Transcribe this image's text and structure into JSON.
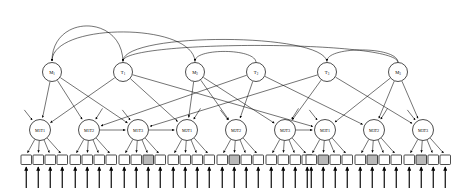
{
  "diagram": {
    "type": "directed-acyclic-graph",
    "canvas": {
      "width": 453,
      "height": 190
    },
    "levels": [
      {
        "name": "top-level",
        "y": 72,
        "nodes": [
          {
            "id": "M1",
            "label": "M",
            "sub": "1",
            "x": 52,
            "r": 9.5
          },
          {
            "id": "T1",
            "label": "T",
            "sub": "1",
            "x": 123,
            "r": 9.5
          },
          {
            "id": "M2",
            "label": "M",
            "sub": "2",
            "x": 195,
            "r": 9.5
          },
          {
            "id": "T2",
            "label": "T",
            "sub": "2",
            "x": 256,
            "r": 9.5
          },
          {
            "id": "T3",
            "label": "T",
            "sub": "3",
            "x": 327,
            "r": 9.5
          },
          {
            "id": "M3",
            "label": "M",
            "sub": "3",
            "x": 398,
            "r": 9.5
          }
        ]
      },
      {
        "name": "mid-level",
        "y": 130,
        "nodes": [
          {
            "id": "M1T1",
            "label": "M1T1",
            "x": 40,
            "r": 10.5
          },
          {
            "id": "M1T2",
            "label": "M1T2",
            "x": 89,
            "r": 10.5
          },
          {
            "id": "M1T3",
            "label": "M1T3",
            "x": 138,
            "r": 10.5
          },
          {
            "id": "M2T1",
            "label": "M2T1",
            "x": 187,
            "r": 10.5
          },
          {
            "id": "M2T2",
            "label": "M2T2",
            "x": 236,
            "r": 10.5
          },
          {
            "id": "M2T3",
            "label": "M2T3",
            "x": 285,
            "r": 10.5
          },
          {
            "id": "M3T1",
            "label": "M3T1",
            "x": 325,
            "r": 10.5
          },
          {
            "id": "M3T2",
            "label": "M3T2",
            "x": 374,
            "r": 10.5
          },
          {
            "id": "M3T3",
            "label": "M3T3",
            "x": 423,
            "r": 10.5
          }
        ]
      },
      {
        "name": "observation-level",
        "y": 155,
        "square": {
          "w": 10.5,
          "h": 9.5
        },
        "groups": [
          {
            "parent": "M1T1",
            "squares": [
              {
                "x": 21,
                "shaded": false
              },
              {
                "x": 33,
                "shaded": false
              },
              {
                "x": 45,
                "shaded": false
              },
              {
                "x": 57,
                "shaded": false
              }
            ]
          },
          {
            "parent": "M1T2",
            "squares": [
              {
                "x": 70,
                "shaded": false
              },
              {
                "x": 82,
                "shaded": false
              },
              {
                "x": 94,
                "shaded": false
              },
              {
                "x": 106,
                "shaded": false
              }
            ]
          },
          {
            "parent": "M1T3",
            "squares": [
              {
                "x": 119,
                "shaded": false
              },
              {
                "x": 131,
                "shaded": false
              },
              {
                "x": 143,
                "shaded": true
              },
              {
                "x": 155,
                "shaded": false
              }
            ]
          },
          {
            "parent": "M2T1",
            "squares": [
              {
                "x": 168,
                "shaded": false
              },
              {
                "x": 180,
                "shaded": false
              },
              {
                "x": 192,
                "shaded": false
              },
              {
                "x": 204,
                "shaded": false
              }
            ]
          },
          {
            "parent": "M2T2",
            "squares": [
              {
                "x": 217,
                "shaded": false
              },
              {
                "x": 229,
                "shaded": true
              },
              {
                "x": 241,
                "shaded": false
              },
              {
                "x": 253,
                "shaded": false
              }
            ]
          },
          {
            "parent": "M2T3",
            "squares": [
              {
                "x": 266,
                "shaded": false
              },
              {
                "x": 278,
                "shaded": false
              },
              {
                "x": 290,
                "shaded": false
              },
              {
                "x": 302,
                "shaded": false
              }
            ]
          },
          {
            "parent": "M3T1",
            "squares": [
              {
                "x": 306,
                "shaded": false
              },
              {
                "x": 318,
                "shaded": true
              },
              {
                "x": 330,
                "shaded": false
              },
              {
                "x": 342,
                "shaded": false
              }
            ]
          },
          {
            "parent": "M3T2",
            "squares": [
              {
                "x": 355,
                "shaded": false
              },
              {
                "x": 367,
                "shaded": true
              },
              {
                "x": 379,
                "shaded": false
              },
              {
                "x": 391,
                "shaded": false
              }
            ]
          },
          {
            "parent": "M3T3",
            "squares": [
              {
                "x": 404,
                "shaded": false
              },
              {
                "x": 416,
                "shaded": true
              },
              {
                "x": 428,
                "shaded": false
              },
              {
                "x": 440,
                "shaded": false
              }
            ]
          }
        ]
      }
    ],
    "long_arcs": [
      {
        "from": "T1",
        "to": "M1",
        "peak_y": 14
      },
      {
        "from": "M2",
        "to": "M1",
        "peak_y": 22
      },
      {
        "from": "T3",
        "to": "T1",
        "peak_y": 32
      },
      {
        "from": "M3",
        "to": "T1",
        "peak_y": 40
      },
      {
        "from": "T2",
        "to": "M2",
        "peak_y": 48
      },
      {
        "from": "M3",
        "to": "T3",
        "peak_y": 46
      }
    ],
    "top_to_mid_edges": [
      {
        "from": "M1",
        "to": "M1T1"
      },
      {
        "from": "M1",
        "to": "M1T2"
      },
      {
        "from": "M1",
        "to": "M1T3"
      },
      {
        "from": "T1",
        "to": "M1T1"
      },
      {
        "from": "T1",
        "to": "M2T1"
      },
      {
        "from": "T1",
        "to": "M3T1"
      },
      {
        "from": "M2",
        "to": "M2T1"
      },
      {
        "from": "M2",
        "to": "M2T2"
      },
      {
        "from": "M2",
        "to": "M2T3"
      },
      {
        "from": "T2",
        "to": "M1T2"
      },
      {
        "from": "T2",
        "to": "M2T2"
      },
      {
        "from": "T2",
        "to": "M3T2"
      },
      {
        "from": "T3",
        "to": "M1T3"
      },
      {
        "from": "T3",
        "to": "M2T3"
      },
      {
        "from": "T3",
        "to": "M3T3"
      },
      {
        "from": "M3",
        "to": "M3T1"
      },
      {
        "from": "M3",
        "to": "M3T2"
      },
      {
        "from": "M3",
        "to": "M3T3"
      }
    ],
    "lateral_edges": [
      {
        "from": "M1T2",
        "to": "M1T3"
      },
      {
        "from": "M1T3",
        "to": "M2T1"
      },
      {
        "from": "M2T3",
        "to": "M3T1"
      }
    ],
    "free_incoming_arrows": [
      {
        "to": "M1T1"
      },
      {
        "to": "M1T2"
      },
      {
        "to": "M1T3"
      },
      {
        "to": "M2T1"
      },
      {
        "to": "M2T2"
      },
      {
        "to": "M2T3"
      },
      {
        "to": "M3T1"
      },
      {
        "to": "M3T2"
      },
      {
        "to": "M3T3"
      }
    ],
    "input_arrow_count": 36,
    "colors": {
      "background": "#ffffff",
      "stroke": "#000000",
      "node_fill": "#ffffff",
      "shaded_square_fill": "#b9b9b9"
    }
  }
}
